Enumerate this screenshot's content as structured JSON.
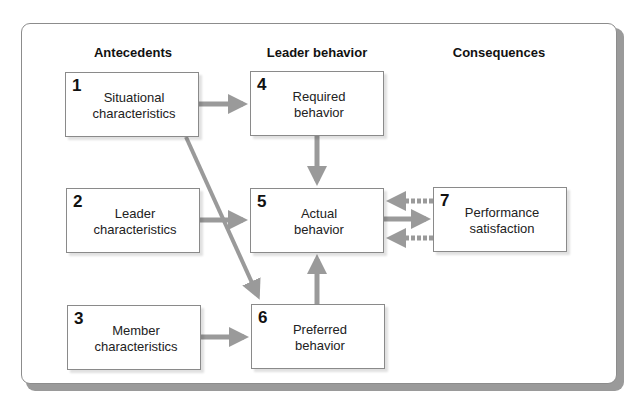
{
  "columns": {
    "antecedents": "Antecedents",
    "leader_behavior": "Leader behavior",
    "consequences": "Consequences"
  },
  "boxes": [
    {
      "id": "1",
      "number": "1",
      "line1": "Situational",
      "line2": "characteristics"
    },
    {
      "id": "2",
      "number": "2",
      "line1": "Leader",
      "line2": "characteristics"
    },
    {
      "id": "3",
      "number": "3",
      "line1": "Member",
      "line2": "characteristics"
    },
    {
      "id": "4",
      "number": "4",
      "line1": "Required",
      "line2": "behavior"
    },
    {
      "id": "5",
      "number": "5",
      "line1": "Actual",
      "line2": "behavior"
    },
    {
      "id": "6",
      "number": "6",
      "line1": "Preferred",
      "line2": "behavior"
    },
    {
      "id": "7",
      "number": "7",
      "line1": "Performance",
      "line2": "satisfaction"
    }
  ],
  "edges": [
    {
      "from": "1",
      "to": "4",
      "style": "solid"
    },
    {
      "from": "1",
      "to": "6",
      "style": "solid"
    },
    {
      "from": "2",
      "to": "5",
      "style": "solid"
    },
    {
      "from": "3",
      "to": "6",
      "style": "solid"
    },
    {
      "from": "4",
      "to": "5",
      "style": "solid"
    },
    {
      "from": "6",
      "to": "5",
      "style": "solid"
    },
    {
      "from": "5",
      "to": "7",
      "style": "solid"
    },
    {
      "from": "7",
      "to": "5",
      "style": "dashed"
    },
    {
      "from": "7",
      "to": "5",
      "style": "dashed"
    }
  ],
  "colors": {
    "arrow": "#9a9a9a",
    "box_border": "#8a8a8a",
    "frame_shadow": "#9a9a9a"
  }
}
